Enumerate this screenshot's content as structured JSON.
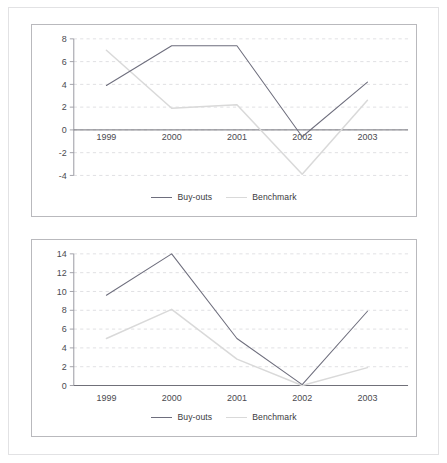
{
  "figure": {
    "panels": [
      {
        "id": "top",
        "legend": [
          {
            "name": "series-buyouts",
            "label": "Buy-outs",
            "color": "#6e6e7d"
          },
          {
            "name": "series-benchmark",
            "label": "Benchmark",
            "color": "#d9d9d9"
          }
        ]
      },
      {
        "id": "bottom",
        "legend": [
          {
            "name": "series-buyouts",
            "label": "Buy-outs",
            "color": "#6e6e7d"
          },
          {
            "name": "series-benchmark",
            "label": "Benchmark",
            "color": "#d9d9d9"
          }
        ]
      }
    ]
  },
  "chart_data": [
    {
      "type": "line",
      "id": "top-chart",
      "title": "",
      "xlabel": "",
      "ylabel": "",
      "categories": [
        "1999",
        "2000",
        "2001",
        "2002",
        "2003"
      ],
      "x_tick_labels": [
        "1999",
        "2000",
        "2001",
        "2002",
        "2003"
      ],
      "y_tick_labels": [
        "8",
        "6",
        "4",
        "2",
        "0",
        "-2",
        "-4"
      ],
      "y_ticks": [
        8,
        6,
        4,
        2,
        0,
        -2,
        -4
      ],
      "ylim": [
        -4,
        8
      ],
      "grid": true,
      "grid_style": "dashed",
      "legend_position": "bottom-center",
      "series": [
        {
          "name": "Buy-outs",
          "color": "#6e6e7d",
          "values": [
            3.9,
            7.4,
            7.4,
            -0.6,
            4.2
          ]
        },
        {
          "name": "Benchmark",
          "color": "#d9d9d9",
          "values": [
            7.0,
            1.9,
            2.2,
            -3.9,
            2.6
          ]
        }
      ]
    },
    {
      "type": "line",
      "id": "bottom-chart",
      "title": "",
      "xlabel": "",
      "ylabel": "",
      "categories": [
        "1999",
        "2000",
        "2001",
        "2002",
        "2003"
      ],
      "x_tick_labels": [
        "1999",
        "2000",
        "2001",
        "2002",
        "2003"
      ],
      "y_tick_labels": [
        "14",
        "12",
        "10",
        "8",
        "6",
        "4",
        "2",
        "0"
      ],
      "y_ticks": [
        14,
        12,
        10,
        8,
        6,
        4,
        2,
        0
      ],
      "ylim": [
        0,
        14
      ],
      "grid": true,
      "grid_style": "dashed",
      "legend_position": "bottom-center",
      "series": [
        {
          "name": "Buy-outs",
          "color": "#6e6e7d",
          "values": [
            9.6,
            14.0,
            5.0,
            0.1,
            7.9
          ]
        },
        {
          "name": "Benchmark",
          "color": "#d9d9d9",
          "values": [
            5.0,
            8.1,
            2.8,
            0.0,
            1.9
          ]
        }
      ]
    }
  ]
}
